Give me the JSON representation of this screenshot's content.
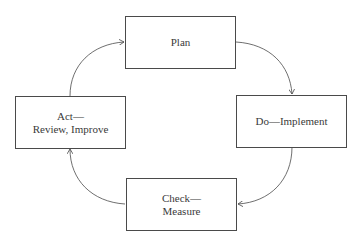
{
  "diagram": {
    "type": "cycle",
    "nodes": [
      {
        "id": "plan",
        "lines": [
          "Plan"
        ]
      },
      {
        "id": "do",
        "lines": [
          "Do—Implement"
        ]
      },
      {
        "id": "check",
        "lines": [
          "Check—",
          "Measure"
        ]
      },
      {
        "id": "act",
        "lines": [
          "Act—",
          "Review, Improve"
        ]
      }
    ],
    "edges": [
      {
        "from": "plan",
        "to": "do"
      },
      {
        "from": "do",
        "to": "check"
      },
      {
        "from": "check",
        "to": "act"
      },
      {
        "from": "act",
        "to": "plan"
      }
    ],
    "colors": {
      "stroke": "#4a4a4a",
      "text": "#3a3a3a",
      "background": "#ffffff"
    }
  }
}
